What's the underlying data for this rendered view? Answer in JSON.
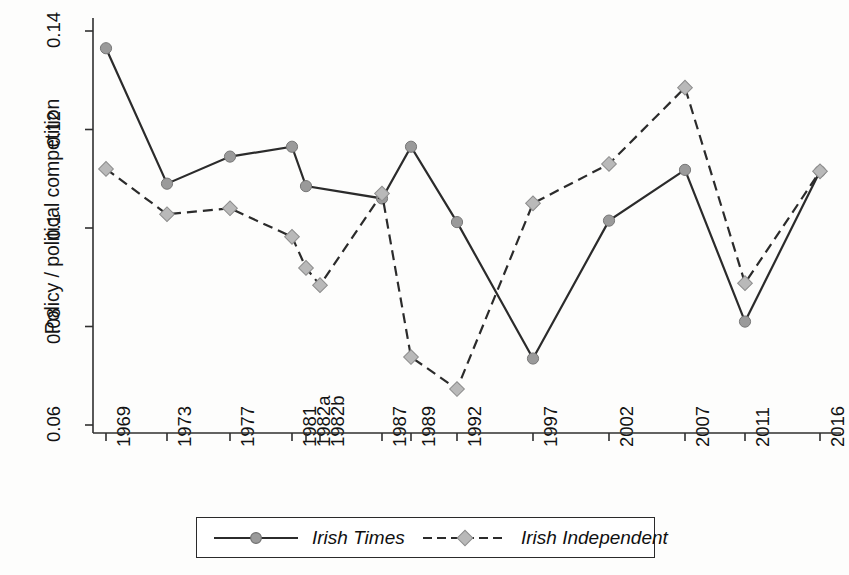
{
  "chart_data": {
    "type": "line",
    "title": "",
    "xlabel": "",
    "ylabel": "Policy / political competition",
    "categories": [
      "1969",
      "1973",
      "1977",
      "1981",
      "1982a",
      "1982b",
      "1987",
      "1989",
      "1992",
      "1997",
      "2002",
      "2007",
      "2011",
      "2016"
    ],
    "ylim": [
      0.06,
      0.14
    ],
    "yticks": [
      0.06,
      0.08,
      0.1,
      0.12,
      0.14
    ],
    "ytick_labels": [
      "0.06",
      "0.08",
      "0.1",
      "0.12",
      "0.14"
    ],
    "grid": false,
    "legend_position": "bottom",
    "series": [
      {
        "name": "Irish Times",
        "marker": "circle",
        "line_style": "solid",
        "color": "#2b2b2b",
        "marker_color": "#9a9a9a",
        "values": [
          0.1365,
          0.109,
          0.1145,
          0.1165,
          0.1085,
          null,
          0.106,
          0.1165,
          0.1012,
          0.0735,
          0.1015,
          0.1118,
          0.081,
          0.1115
        ]
      },
      {
        "name": "Irish Independent",
        "marker": "diamond",
        "line_style": "dashed",
        "color": "#2b2b2b",
        "marker_color": "#b9b9b9",
        "values": [
          0.112,
          0.1028,
          0.104,
          0.0982,
          0.0919,
          0.0884,
          0.107,
          0.0738,
          0.0673,
          0.105,
          0.113,
          0.1285,
          0.0888,
          0.1115
        ]
      }
    ]
  },
  "axes": {
    "y_label": "Policy / political competition",
    "y_tick_labels": [
      "0.14",
      "0.12",
      "0.1",
      "0.08",
      "0.06"
    ],
    "x_tick_labels": [
      "1969",
      "1973",
      "1977",
      "1981",
      "1982a",
      "1982b",
      "1987",
      "1989",
      "1992",
      "1997",
      "2002",
      "2007",
      "2011",
      "2016"
    ]
  },
  "legend": {
    "items": [
      {
        "label": "Irish Times",
        "marker": "circle-marker",
        "line": "solid-line"
      },
      {
        "label": "Irish Independent",
        "marker": "diamond-marker",
        "line": "dashed-line"
      }
    ]
  }
}
